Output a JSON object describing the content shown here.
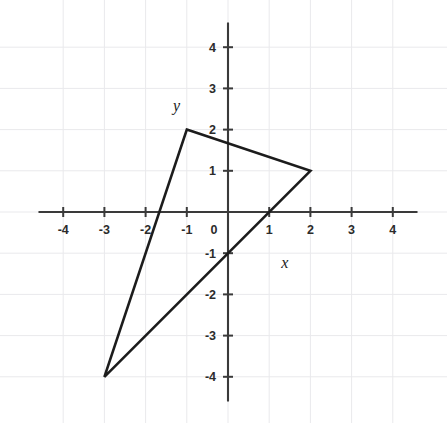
{
  "figure": {
    "background_color": "#ffffff",
    "axis_color": "#3a3a3a",
    "grid_color": "#e9e9ec",
    "shape_color": "#1c1c1c"
  },
  "axis_labels": {
    "x_name": "x",
    "y_name": "y"
  },
  "chart_data": {
    "type": "scatter",
    "title": "",
    "subtitle": "",
    "xlabel": "x",
    "ylabel": "y",
    "xlim": [
      -4.6,
      4.6
    ],
    "ylim": [
      -4.6,
      4.6
    ],
    "grid": true,
    "legend": null,
    "x_ticks": [
      -4,
      -3,
      -2,
      -1,
      0,
      1,
      2,
      3,
      4
    ],
    "y_ticks": [
      -4,
      -3,
      -2,
      -1,
      0,
      1,
      2,
      3,
      4
    ],
    "x_tick_labels": [
      "-4",
      "-3",
      "-2",
      "-1",
      "0",
      "1",
      "2",
      "3",
      "4"
    ],
    "y_tick_labels": [
      "-4",
      "-3",
      "-2",
      "-1",
      "0",
      "1",
      "2",
      "3",
      "4"
    ],
    "series": [
      {
        "name": "triangle",
        "kind": "polygon",
        "closed": true,
        "filled": false,
        "vertices": [
          {
            "label": "A",
            "x": -1,
            "y": 2
          },
          {
            "label": "B",
            "x": 2,
            "y": 1
          },
          {
            "label": "C",
            "x": -3,
            "y": -4
          }
        ],
        "edges": [
          {
            "from": "A",
            "to": "B"
          },
          {
            "from": "B",
            "to": "C"
          },
          {
            "from": "C",
            "to": "A"
          }
        ]
      }
    ],
    "annotations": [
      {
        "text": "y",
        "x": -1.25,
        "y": 2.45,
        "style": "italic-serif"
      },
      {
        "text": "x",
        "x": 1.38,
        "y": -1.35,
        "style": "italic-serif"
      }
    ]
  }
}
